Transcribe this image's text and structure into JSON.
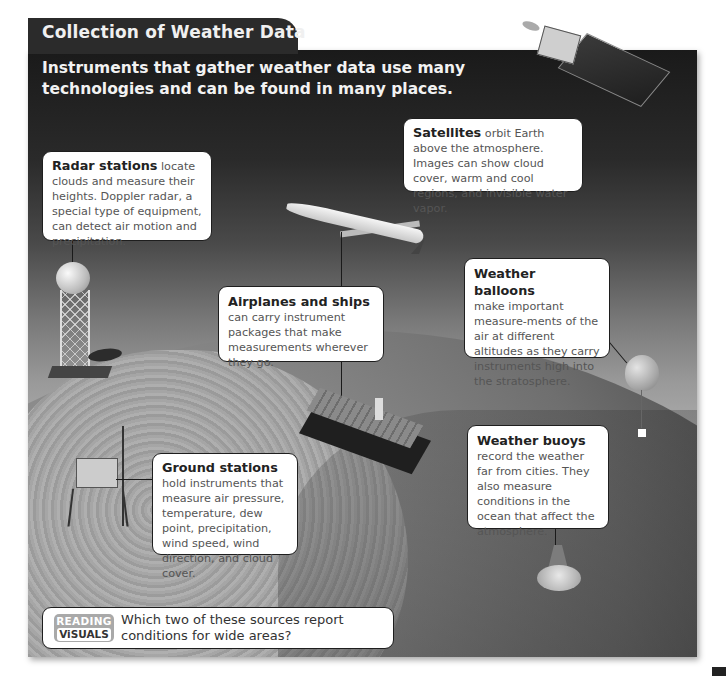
{
  "header": {
    "title": "Collection of Weather Data",
    "subtitle": "Instruments that gather weather data use many technologies and can be found in many places."
  },
  "callouts": {
    "radar": {
      "lead": "Radar stations",
      "text": " locate clouds and measure their heights. Doppler radar, a special type of equipment, can detect air motion and precipitation."
    },
    "satellites": {
      "lead": "Satellites",
      "text": " orbit Earth above the atmosphere. Images can show cloud cover, warm and cool regions, and invisible water vapor."
    },
    "airplanes": {
      "lead": "Airplanes and ships",
      "text": "can carry instrument packages that make measurements wherever they go."
    },
    "balloons": {
      "lead": "Weather balloons",
      "text": "make important measure-ments of the air at different altitudes as they carry instruments high into the stratosphere."
    },
    "buoys": {
      "lead": "Weather buoys",
      "text": "record the weather far from cities. They also measure conditions in the ocean that affect the atmosphere."
    },
    "ground": {
      "lead": "Ground stations",
      "text": " hold instruments that measure air pressure, temperature, dew point, precipitation, wind speed, wind direction, and cloud cover."
    }
  },
  "reading_visuals": {
    "badge_top": "READING",
    "badge_bottom": "ViSUALS",
    "question": "Which two of these sources report conditions for wide areas?"
  },
  "illustrations": [
    "satellite",
    "radar-station",
    "airplane",
    "ship",
    "weather-balloon",
    "weather-buoy",
    "ground-station",
    "earth"
  ]
}
